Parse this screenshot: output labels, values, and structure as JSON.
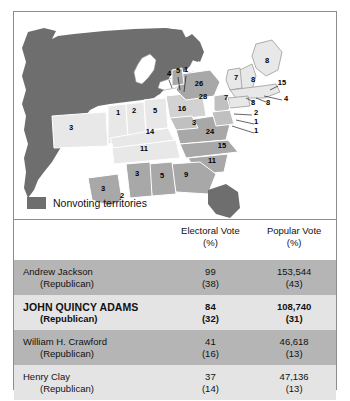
{
  "figure": {
    "legend": {
      "swatch_color": "#6e6e6e",
      "label": "Nonvoting territories"
    }
  },
  "map": {
    "territory_color": "#6e6e6e",
    "state_light_color": "#e8e8e8",
    "state_mid_color": "#a8a8a8",
    "state_dark_color": "#8a8a8a",
    "labels": [
      {
        "id": "missouri",
        "value": "3",
        "x": 57,
        "y": 118
      },
      {
        "id": "illinois",
        "value": "1",
        "x": 104,
        "y": 103
      },
      {
        "id": "indiana",
        "value": "2",
        "x": 120,
        "y": 101
      },
      {
        "id": "ohio",
        "value": "5",
        "x": 141,
        "y": 101
      },
      {
        "id": "pennsylvania",
        "value": "16",
        "x": 168,
        "y": 99
      },
      {
        "id": "kentucky",
        "value": "14",
        "x": 136,
        "y": 122
      },
      {
        "id": "tennessee",
        "value": "11",
        "x": 130,
        "y": 139
      },
      {
        "id": "virginia",
        "value": "24",
        "x": 196,
        "y": 122
      },
      {
        "id": "west-va",
        "value": "3",
        "x": 180,
        "y": 113
      },
      {
        "id": "new-york",
        "value": "28",
        "x": 189,
        "y": 87
      },
      {
        "id": "new-jersey",
        "value": "7",
        "x": 212,
        "y": 88
      },
      {
        "id": "north-carolina",
        "value": "15",
        "x": 208,
        "y": 136
      },
      {
        "id": "south-carolina",
        "value": "11",
        "x": 198,
        "y": 151
      },
      {
        "id": "georgia",
        "value": "9",
        "x": 172,
        "y": 165
      },
      {
        "id": "alabama",
        "value": "5",
        "x": 148,
        "y": 166
      },
      {
        "id": "mississippi",
        "value": "3",
        "x": 123,
        "y": 164
      },
      {
        "id": "louisiana",
        "value": "3",
        "x": 89,
        "y": 179
      },
      {
        "id": "delta-2",
        "value": "2",
        "x": 108,
        "y": 186
      },
      {
        "id": "michigan-terr",
        "value": "4",
        "x": 155,
        "y": 64
      },
      {
        "id": "lake-5",
        "value": "5",
        "x": 164,
        "y": 61
      },
      {
        "id": "lake-1",
        "value": "1",
        "x": 172,
        "y": 60
      },
      {
        "id": "vermont",
        "value": "26",
        "x": 185,
        "y": 74
      },
      {
        "id": "new-hampshire",
        "value": "7",
        "x": 222,
        "y": 68
      },
      {
        "id": "maine",
        "value": "8",
        "x": 253,
        "y": 51
      },
      {
        "id": "vt-8",
        "value": "8",
        "x": 239,
        "y": 70
      },
      {
        "id": "massachusetts",
        "value": "15",
        "x": 268,
        "y": 73
      },
      {
        "id": "rhode-island",
        "value": "4",
        "x": 272,
        "y": 89
      },
      {
        "id": "connecticut-8",
        "value": "8",
        "x": 239,
        "y": 93
      },
      {
        "id": "ct-8b",
        "value": "8",
        "x": 254,
        "y": 93
      },
      {
        "id": "maryland-2",
        "value": "2",
        "x": 242,
        "y": 103
      },
      {
        "id": "delaware-1",
        "value": "1",
        "x": 242,
        "y": 112
      },
      {
        "id": "dc-1",
        "value": "1",
        "x": 242,
        "y": 121
      }
    ]
  },
  "table": {
    "headers": {
      "candidate": "",
      "electoral_vote": "Electoral Vote",
      "electoral_pct": "(%)",
      "popular_vote": "Popular Vote",
      "popular_pct": "(%)"
    },
    "rows": [
      {
        "name": "Andrew Jackson",
        "party": "(Republican)",
        "electoral": "99",
        "electoral_pct": "(38)",
        "popular": "153,544",
        "popular_pct": "(43)",
        "winner": false,
        "shade": "dark"
      },
      {
        "name": "JOHN QUINCY ADAMS",
        "party": "(Republican)",
        "electoral": "84",
        "electoral_pct": "(32)",
        "popular": "108,740",
        "popular_pct": "(31)",
        "winner": true,
        "shade": "light"
      },
      {
        "name": "William H. Crawford",
        "party": "(Republican)",
        "electoral": "41",
        "electoral_pct": "(16)",
        "popular": "46,618",
        "popular_pct": "(13)",
        "winner": false,
        "shade": "dark"
      },
      {
        "name": "Henry Clay",
        "party": "(Republican)",
        "electoral": "37",
        "electoral_pct": "(14)",
        "popular": "47,136",
        "popular_pct": "(13)",
        "winner": false,
        "shade": "light"
      }
    ]
  }
}
